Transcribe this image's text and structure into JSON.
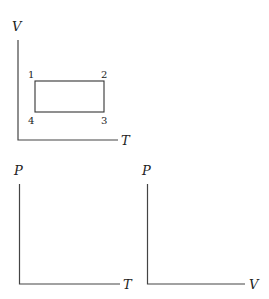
{
  "diagrams": [
    {
      "id": "VT",
      "y_axis_label": "V",
      "x_axis_label": "T",
      "cycle": {
        "shape": "rectangle",
        "points": [
          {
            "label": "1",
            "position": "top-left"
          },
          {
            "label": "2",
            "position": "top-right"
          },
          {
            "label": "3",
            "position": "bottom-right"
          },
          {
            "label": "4",
            "position": "bottom-left"
          }
        ]
      }
    },
    {
      "id": "PT",
      "y_axis_label": "P",
      "x_axis_label": "T"
    },
    {
      "id": "PV",
      "y_axis_label": "P",
      "x_axis_label": "V"
    }
  ],
  "colors": {
    "axis": "#444444",
    "background": "#ffffff"
  }
}
